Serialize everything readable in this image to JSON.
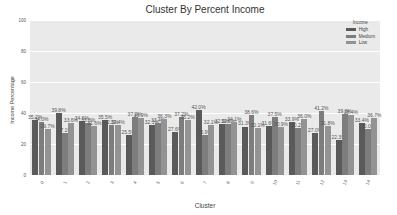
{
  "chart_data": {
    "type": "bar",
    "title": "Cluster By Percent Income",
    "xlabel": "Cluster",
    "ylabel": "Income Percentage",
    "ylim": [
      0,
      100
    ],
    "yticks": [
      0,
      20,
      40,
      60,
      80,
      100
    ],
    "grid": true,
    "legend_position": "upper right",
    "legend_title": "Income",
    "categories": [
      "0",
      "1",
      "2",
      "3",
      "4",
      "5",
      "6",
      "7",
      "8",
      "9",
      "10",
      "11",
      "12",
      "13",
      "14"
    ],
    "series": [
      {
        "name": "High",
        "color": "#5a5a5a",
        "values": [
          35.2,
          39.8,
          34.6,
          35.5,
          25.5,
          32.1,
          27.6,
          42.0,
          32.9,
          31.3,
          31.6,
          33.9,
          27.0,
          22.3,
          33.4
        ]
      },
      {
        "name": "Medium",
        "color": "#7d7d7d",
        "values": [
          34.0,
          27.1,
          33.8,
          32.3,
          37.2,
          33.4,
          37.2,
          25.9,
          32.9,
          38.6,
          37.5,
          30.2,
          41.2,
          39.3,
          30.0
        ]
      },
      {
        "name": "Low",
        "color": "#939393",
        "values": [
          29.7,
          33.6,
          31.6,
          32.4,
          36.9,
          36.3,
          35.2,
          32.1,
          34.1,
          30.1,
          30.9,
          36.0,
          31.8,
          38.4,
          36.7
        ]
      }
    ]
  }
}
